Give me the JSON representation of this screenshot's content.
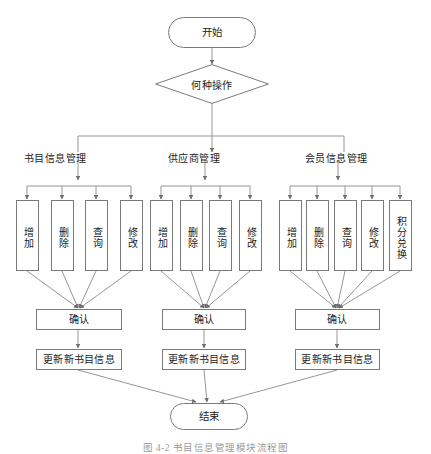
{
  "diagram": {
    "type": "flowchart",
    "language": "zh-CN",
    "start": {
      "label": "开始",
      "shape": "terminal"
    },
    "decision": {
      "label": "何种操作",
      "shape": "diamond"
    },
    "branches": [
      {
        "label": "书目信息管理",
        "operations": [
          {
            "label": "增加"
          },
          {
            "label": "删除"
          },
          {
            "label": "查询"
          },
          {
            "label": "修改"
          }
        ],
        "confirm": {
          "label": "确认"
        },
        "update": {
          "label": "更新新书目信息"
        }
      },
      {
        "label": "供应商管理",
        "operations": [
          {
            "label": "增加"
          },
          {
            "label": "删除"
          },
          {
            "label": "查询"
          },
          {
            "label": "修改"
          }
        ],
        "confirm": {
          "label": "确认"
        },
        "update": {
          "label": "更新新书目信息"
        }
      },
      {
        "label": "会员信息管理",
        "operations": [
          {
            "label": "增加"
          },
          {
            "label": "删除"
          },
          {
            "label": "查询"
          },
          {
            "label": "修改"
          },
          {
            "label": "积分兑换"
          }
        ],
        "confirm": {
          "label": "确认"
        },
        "update": {
          "label": "更新新书目信息"
        }
      }
    ],
    "end": {
      "label": "结束",
      "shape": "terminal"
    },
    "caption": "图 4-2   书目信息管理模块流程图",
    "colors": {
      "stroke": "#7a7a7a",
      "text": "#222222",
      "background": "#ffffff",
      "caption": "#9a9a9a"
    }
  }
}
